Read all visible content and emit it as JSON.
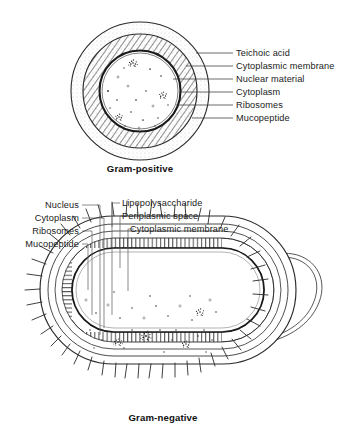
{
  "figure": {
    "background_color": "#ffffff",
    "ink_color": "#1a1a1a"
  },
  "gram_positive": {
    "caption": "Gram-positive",
    "labels": [
      {
        "id": "teichoic-acid",
        "text": "Teichoic acid"
      },
      {
        "id": "cytoplasmic-membrane",
        "text": "Cytoplasmic membrane"
      },
      {
        "id": "nuclear-material",
        "text": "Nuclear material"
      },
      {
        "id": "cytoplasm",
        "text": "Cytoplasm"
      },
      {
        "id": "ribosomes",
        "text": "Ribosomes"
      },
      {
        "id": "mucopeptide",
        "text": "Mucopeptide"
      }
    ]
  },
  "gram_negative": {
    "caption": "Gram-negative",
    "labels_left": [
      {
        "id": "nucleus",
        "text": "Nucleus"
      },
      {
        "id": "cytoplasm",
        "text": "Cytoplasm"
      },
      {
        "id": "ribosomes",
        "text": "Ribosomes"
      },
      {
        "id": "mucopeptide",
        "text": "Mucopeptide"
      }
    ],
    "labels_right": [
      {
        "id": "lipopolysaccharide",
        "text": "Lipopolysaccharide"
      },
      {
        "id": "periplasmic-space",
        "text": "Periplasmic space"
      },
      {
        "id": "cytoplasmic-membrane",
        "text": "Cytoplasmic membrane"
      }
    ]
  }
}
